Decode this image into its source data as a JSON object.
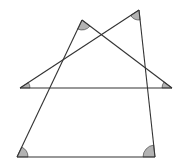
{
  "diagram": {
    "width": 183,
    "height": 166,
    "stroke_color": "#333333",
    "fill_color": "#b3b3b3",
    "points": {
      "A": [
        82,
        20
      ],
      "B": [
        139,
        10
      ],
      "C": [
        20,
        88
      ],
      "D": [
        172,
        88
      ],
      "E": [
        17,
        157
      ],
      "F": [
        155,
        157
      ]
    },
    "segments": [
      {
        "name": "segment-E-A",
        "from": "E",
        "to": "A"
      },
      {
        "name": "segment-A-D",
        "from": "A",
        "to": "D"
      },
      {
        "name": "segment-C-B",
        "from": "C",
        "to": "B"
      },
      {
        "name": "segment-B-F",
        "from": "B",
        "to": "F"
      },
      {
        "name": "segment-C-D",
        "from": "C",
        "to": "D"
      },
      {
        "name": "segment-E-F",
        "from": "E",
        "to": "F"
      }
    ],
    "angle_marks": [
      {
        "name": "angle-mark-A",
        "vertex": "A",
        "r": 10
      },
      {
        "name": "angle-mark-B",
        "vertex": "B",
        "r": 10
      },
      {
        "name": "angle-mark-C",
        "vertex": "C",
        "r": 10
      },
      {
        "name": "angle-mark-D",
        "vertex": "D",
        "r": 10
      },
      {
        "name": "angle-mark-E",
        "vertex": "E",
        "r": 11
      },
      {
        "name": "angle-mark-F",
        "vertex": "F",
        "r": 12
      }
    ]
  }
}
